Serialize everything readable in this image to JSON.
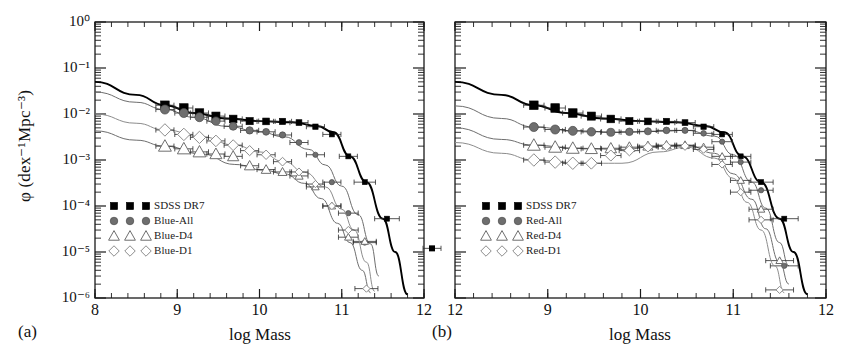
{
  "figure": {
    "width": 852,
    "height": 361,
    "background": "#ffffff"
  },
  "axis_label_y": "φ (dex⁻¹Mpc⁻³)",
  "panels": [
    {
      "tag": "(a)",
      "xlabel": "log Mass",
      "xticks": [
        "8",
        "9",
        "10",
        "11",
        "12"
      ],
      "yticks": [
        "10⁰",
        "10⁻¹",
        "10⁻²",
        "10⁻³",
        "10⁻⁴",
        "10⁻⁵",
        "10⁻⁶"
      ],
      "legend": [
        "SDSS DR7",
        "Blue-All",
        "Blue-D4",
        "Blue-D1"
      ]
    },
    {
      "tag": "(b)",
      "xlabel": "log Mass",
      "xticks": [
        "12",
        "9",
        "10",
        "11",
        "12"
      ],
      "legend": [
        "SDSS DR7",
        "Red-All",
        "Red-D4",
        "Red-D1"
      ]
    }
  ],
  "colors": {
    "sdss": "#000000",
    "all": "#6e6e6e",
    "d4_line": "#6e6e6e",
    "d1_line": "#8c8c8c",
    "marker_open_fill": "#ffffff",
    "axis": "#1a1a1a"
  },
  "chart_data": {
    "type": "line",
    "title": "",
    "xlabel": "log Mass",
    "ylabel": "φ (dex⁻¹Mpc⁻³)",
    "xlim": [
      8,
      12
    ],
    "ylim": [
      1e-06,
      1
    ],
    "yscale": "log",
    "grid": false,
    "legend_position": "lower-left",
    "panels": [
      {
        "tag": "(a)",
        "legend": [
          "SDSS DR7",
          "Blue-All",
          "Blue-D4",
          "Blue-D1"
        ],
        "series": [
          {
            "name": "SDSS DR7",
            "marker": "filled-square",
            "color": "#000000",
            "model_x": [
              8.0,
              8.5,
              8.85,
              9.2,
              9.6,
              10.0,
              10.4,
              10.7,
              10.9,
              11.1,
              11.3,
              11.5,
              11.65,
              11.8
            ],
            "model_y": [
              0.05,
              0.026,
              0.0155,
              0.0105,
              0.008,
              0.007,
              0.0066,
              0.0055,
              0.004,
              0.0012,
              0.00033,
              5.3e-05,
              1e-05,
              1.2e-06
            ],
            "x": [
              8.85,
              9.08,
              9.27,
              9.47,
              9.68,
              9.88,
              10.08,
              10.28,
              10.48,
              10.68,
              10.88,
              11.08,
              11.28,
              11.55
            ],
            "y": [
              0.0155,
              0.0135,
              0.0105,
              0.009,
              0.0078,
              0.007,
              0.0069,
              0.0069,
              0.0065,
              0.0053,
              0.0036,
              0.0012,
              0.00033,
              5.3e-05
            ],
            "xerr": [
              0.11,
              0.11,
              0.11,
              0.11,
              0.11,
              0.11,
              0.11,
              0.11,
              0.11,
              0.11,
              0.11,
              0.11,
              0.13,
              0.15
            ]
          },
          {
            "name": "Blue-All",
            "marker": "filled-circle",
            "color": "#6e6e6e",
            "model_x": [
              8.0,
              8.5,
              8.85,
              9.2,
              9.6,
              10.0,
              10.3,
              10.6,
              10.8,
              11.0,
              11.2,
              11.35,
              11.45
            ],
            "model_y": [
              0.03,
              0.018,
              0.0125,
              0.0085,
              0.0054,
              0.0041,
              0.0032,
              0.0017,
              0.00078,
              0.00027,
              6.5e-05,
              1.5e-05,
              3e-06
            ],
            "x": [
              8.85,
              9.08,
              9.27,
              9.47,
              9.68,
              9.88,
              10.08,
              10.28,
              10.48,
              10.68,
              10.88,
              11.08,
              11.28
            ],
            "y": [
              0.0125,
              0.0105,
              0.0085,
              0.007,
              0.0054,
              0.0044,
              0.0041,
              0.0035,
              0.0024,
              0.0013,
              0.00033,
              7e-05,
              1.6e-05
            ],
            "xerr": [
              0.11,
              0.11,
              0.11,
              0.11,
              0.11,
              0.11,
              0.11,
              0.11,
              0.11,
              0.11,
              0.11,
              0.12,
              0.14
            ]
          },
          {
            "name": "Blue-D4",
            "marker": "open-triangle",
            "color": "#6e6e6e",
            "model_x": [
              8.0,
              8.5,
              8.85,
              9.3,
              9.7,
              10.05,
              10.3,
              10.55,
              10.75,
              10.95,
              11.1,
              11.25,
              11.35
            ],
            "model_y": [
              0.0043,
              0.0027,
              0.002,
              0.00135,
              0.0008,
              0.0006,
              0.0005,
              0.00031,
              0.000145,
              4.2e-05,
              1.6e-05,
              4e-06,
              1.3e-06
            ],
            "x": [
              8.85,
              9.08,
              9.27,
              9.47,
              9.68,
              9.88,
              10.08,
              10.28,
              10.48,
              10.68,
              10.88,
              11.08,
              11.28
            ],
            "y": [
              0.002,
              0.00175,
              0.0015,
              0.00135,
              0.0012,
              0.00075,
              0.00062,
              0.00055,
              0.00045,
              0.00026,
              0.0001,
              2.1e-05,
              1.7e-05
            ],
            "xerr": [
              0.11,
              0.11,
              0.11,
              0.11,
              0.11,
              0.11,
              0.11,
              0.11,
              0.11,
              0.11,
              0.11,
              0.12,
              0.14
            ]
          },
          {
            "name": "Blue-D1",
            "marker": "open-diamond",
            "color": "#8c8c8c",
            "model_x": [
              8.0,
              8.5,
              8.85,
              9.3,
              9.7,
              10.0,
              10.3,
              10.55,
              10.8,
              11.0,
              11.15,
              11.3,
              11.4
            ],
            "model_y": [
              0.01,
              0.0063,
              0.0045,
              0.0032,
              0.0021,
              0.0015,
              0.00092,
              0.00054,
              0.00026,
              8.5e-05,
              3e-05,
              6e-06,
              1.4e-06
            ],
            "x": [
              8.85,
              9.08,
              9.27,
              9.47,
              9.68,
              9.88,
              10.08,
              10.28,
              10.48,
              10.68,
              10.88,
              11.08,
              11.3
            ],
            "y": [
              0.0045,
              0.0036,
              0.0031,
              0.0026,
              0.0021,
              0.0016,
              0.0013,
              0.00092,
              0.00055,
              0.0003,
              0.0001,
              3e-05,
              1.6e-06
            ],
            "xerr": [
              0.11,
              0.11,
              0.11,
              0.11,
              0.11,
              0.11,
              0.11,
              0.11,
              0.11,
              0.11,
              0.11,
              0.12,
              0.14
            ]
          }
        ]
      },
      {
        "tag": "(b)",
        "legend": [
          "SDSS DR7",
          "Red-All",
          "Red-D4",
          "Red-D1"
        ],
        "series": [
          {
            "name": "SDSS DR7",
            "marker": "filled-square",
            "color": "#000000",
            "model_x": [
              8.0,
              8.5,
              8.85,
              9.2,
              9.6,
              10.0,
              10.4,
              10.7,
              10.9,
              11.1,
              11.3,
              11.5,
              11.65,
              11.8
            ],
            "model_y": [
              0.05,
              0.026,
              0.0155,
              0.0105,
              0.008,
              0.007,
              0.0066,
              0.0055,
              0.004,
              0.0012,
              0.00033,
              5.3e-05,
              1e-05,
              1.2e-06
            ],
            "x": [
              8.85,
              9.08,
              9.27,
              9.47,
              9.68,
              9.88,
              10.08,
              10.28,
              10.48,
              10.68,
              10.88,
              11.08,
              11.3,
              11.55
            ],
            "y": [
              0.0155,
              0.0135,
              0.0105,
              0.009,
              0.0078,
              0.007,
              0.0069,
              0.0069,
              0.0065,
              0.0053,
              0.0036,
              0.0012,
              0.00033,
              5.3e-05
            ],
            "xerr": [
              0.11,
              0.11,
              0.11,
              0.11,
              0.11,
              0.11,
              0.11,
              0.11,
              0.11,
              0.11,
              0.11,
              0.11,
              0.13,
              0.15
            ]
          },
          {
            "name": "Red-All",
            "marker": "filled-circle",
            "color": "#6e6e6e",
            "model_x": [
              8.0,
              8.5,
              8.85,
              9.3,
              9.8,
              10.2,
              10.5,
              10.8,
              11.0,
              11.2,
              11.35,
              11.5,
              11.6
            ],
            "model_y": [
              0.015,
              0.008,
              0.0052,
              0.0043,
              0.004,
              0.0042,
              0.0044,
              0.0033,
              0.0013,
              0.00033,
              9e-05,
              1.6e-05,
              5e-06
            ],
            "x": [
              8.85,
              9.08,
              9.27,
              9.47,
              9.68,
              9.88,
              10.08,
              10.28,
              10.48,
              10.68,
              10.88,
              11.08,
              11.3,
              11.55
            ],
            "y": [
              0.0052,
              0.0046,
              0.0043,
              0.0041,
              0.004,
              0.0041,
              0.0042,
              0.0044,
              0.0044,
              0.0038,
              0.0025,
              0.0009,
              0.00022,
              5e-06
            ],
            "xerr": [
              0.11,
              0.11,
              0.11,
              0.11,
              0.11,
              0.11,
              0.11,
              0.11,
              0.11,
              0.11,
              0.11,
              0.11,
              0.13,
              0.15
            ]
          },
          {
            "name": "Red-D4",
            "marker": "open-triangle",
            "color": "#6e6e6e",
            "model_x": [
              8.0,
              8.5,
              8.85,
              9.3,
              9.8,
              10.2,
              10.5,
              10.8,
              11.0,
              11.2,
              11.35,
              11.5,
              11.6
            ],
            "model_y": [
              0.005,
              0.0028,
              0.0021,
              0.0018,
              0.0017,
              0.002,
              0.0021,
              0.0014,
              0.0005,
              0.00014,
              3.2e-05,
              6e-06,
              2e-06
            ],
            "x": [
              8.85,
              9.08,
              9.27,
              9.47,
              9.68,
              9.88,
              10.08,
              10.28,
              10.48,
              10.68,
              10.88,
              11.08,
              11.3,
              11.5
            ],
            "y": [
              0.0021,
              0.0019,
              0.0018,
              0.00175,
              0.0018,
              0.0019,
              0.002,
              0.0021,
              0.0021,
              0.0019,
              0.0012,
              0.00036,
              8.5e-05,
              6.5e-06
            ],
            "xerr": [
              0.11,
              0.11,
              0.11,
              0.11,
              0.11,
              0.11,
              0.11,
              0.11,
              0.11,
              0.11,
              0.11,
              0.11,
              0.13,
              0.15
            ]
          },
          {
            "name": "Red-D1",
            "marker": "open-diamond",
            "color": "#8c8c8c",
            "model_x": [
              8.0,
              8.5,
              8.85,
              9.3,
              9.8,
              10.2,
              10.5,
              10.8,
              11.0,
              11.15,
              11.3,
              11.45,
              11.55
            ],
            "model_y": [
              0.0024,
              0.0014,
              0.001,
              0.00085,
              0.00085,
              0.0015,
              0.0019,
              0.0011,
              0.0004,
              0.00012,
              3e-05,
              5e-06,
              1.3e-06
            ],
            "x": [
              8.85,
              9.08,
              9.27,
              9.47,
              9.68,
              9.88,
              10.08,
              10.28,
              10.48,
              10.68,
              10.88,
              11.08,
              11.3,
              11.5
            ],
            "y": [
              0.001,
              0.0009,
              0.00085,
              0.00085,
              0.00125,
              0.0016,
              0.0019,
              0.002,
              0.002,
              0.0017,
              0.0008,
              0.0002,
              5e-05,
              1.5e-06
            ],
            "xerr": [
              0.11,
              0.11,
              0.11,
              0.11,
              0.11,
              0.11,
              0.11,
              0.11,
              0.11,
              0.11,
              0.11,
              0.11,
              0.13,
              0.15
            ]
          }
        ]
      }
    ]
  }
}
